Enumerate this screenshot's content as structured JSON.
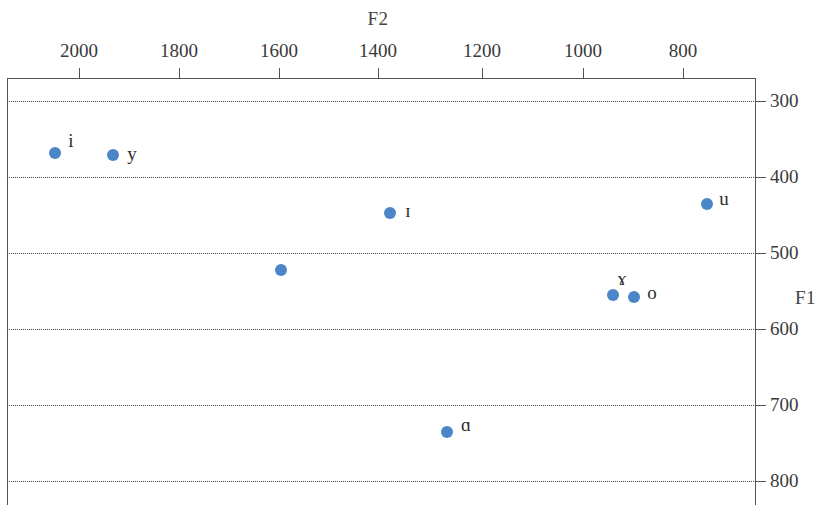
{
  "chart_data": {
    "type": "scatter",
    "title": "",
    "xlabel": "F2",
    "ylabel": "F1",
    "x_axis_position": "top",
    "y_axis_position": "right",
    "x_reversed": true,
    "y_reversed": true,
    "xlim": [
      2100,
      730
    ],
    "ylim": [
      260,
      820
    ],
    "xticks": [
      2000,
      1800,
      1600,
      1400,
      1200,
      1000,
      800
    ],
    "xtick_labels": [
      "2000",
      "1800",
      "1600",
      "1400",
      "1200",
      "1000",
      "800"
    ],
    "yticks": [
      300,
      400,
      500,
      600,
      700,
      800
    ],
    "ytick_labels": [
      "300",
      "400",
      "500",
      "600",
      "700",
      "800"
    ],
    "grid": "horizontal-dotted",
    "legend": "none",
    "marker_color": "#4a86c8",
    "points": [
      {
        "label": "i",
        "F2": 1952,
        "F1": 368,
        "px": 55,
        "py": 153,
        "lx": 71,
        "ly": 141
      },
      {
        "label": "y",
        "F2": 1837,
        "F1": 371,
        "px": 113,
        "py": 155,
        "lx": 132,
        "ly": 154
      },
      {
        "label": "ɪ",
        "F2": 1383,
        "F1": 448,
        "px": 390,
        "py": 213,
        "lx": 408,
        "ly": 211
      },
      {
        "label": "",
        "F2": 1598,
        "F1": 523,
        "px": 281,
        "py": 270,
        "lx": 0,
        "ly": 0
      },
      {
        "label": "ɤ",
        "F2": 939,
        "F1": 555,
        "px": 613,
        "py": 295,
        "lx": 622,
        "ly": 279
      },
      {
        "label": "o",
        "F2": 897,
        "F1": 558,
        "px": 634,
        "py": 297,
        "lx": 652,
        "ly": 293
      },
      {
        "label": "u",
        "F2": 752,
        "F1": 436,
        "px": 707,
        "py": 204,
        "lx": 724,
        "ly": 199
      },
      {
        "label": "ɑ",
        "F2": 1269,
        "F1": 735,
        "px": 447,
        "py": 432,
        "lx": 466,
        "ly": 425
      }
    ]
  },
  "axes": {
    "f2_title": "F2",
    "f1_title": "F1",
    "x_ticks": [
      {
        "value": "2000",
        "px": 79
      },
      {
        "value": "1800",
        "px": 179
      },
      {
        "value": "1600",
        "px": 279
      },
      {
        "value": "1400",
        "px": 378
      },
      {
        "value": "1200",
        "px": 482
      },
      {
        "value": "1000",
        "px": 583
      },
      {
        "value": "800",
        "px": 683
      }
    ],
    "y_ticks": [
      {
        "value": "300",
        "py": 101
      },
      {
        "value": "400",
        "py": 177
      },
      {
        "value": "500",
        "py": 253
      },
      {
        "value": "600",
        "py": 329
      },
      {
        "value": "700",
        "py": 405
      },
      {
        "value": "800",
        "py": 481
      }
    ]
  }
}
